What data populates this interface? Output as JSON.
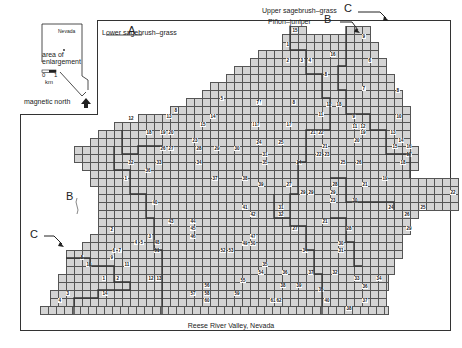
{
  "inset": {
    "state_label": "Nevada",
    "area_label_line1": "area of",
    "area_label_line2": "enlargement",
    "scale_zero": "0",
    "scale_one": "1",
    "scale_unit": "km",
    "north_label": "magnetic north"
  },
  "labels": {
    "lower_sagebrush": "Lower sagebrush–grass",
    "lower_sagebrush_letter": "A",
    "upper_sagebrush": "Upper sagebrush–grass",
    "upper_sagebrush_letter": "C",
    "pinon_juniper": "Piñon–juniper",
    "pinon_juniper_letter": "B",
    "left_b": "B",
    "left_c": "C"
  },
  "caption": "Reese River Valley, Nevada",
  "cell_numbers": [
    {
      "n": "15",
      "x": 292,
      "y": 28
    },
    {
      "n": "9",
      "x": 362,
      "y": 34
    },
    {
      "n": "1",
      "x": 286,
      "y": 42
    },
    {
      "n": "16",
      "x": 330,
      "y": 52
    },
    {
      "n": "2",
      "x": 286,
      "y": 58
    },
    {
      "n": "3",
      "x": 300,
      "y": 58
    },
    {
      "n": "4",
      "x": 308,
      "y": 58
    },
    {
      "n": "6",
      "x": 368,
      "y": 58
    },
    {
      "n": "5",
      "x": 220,
      "y": 96
    },
    {
      "n": "7",
      "x": 258,
      "y": 100
    },
    {
      "n": "7",
      "x": 362,
      "y": 86
    },
    {
      "n": "8",
      "x": 324,
      "y": 72
    },
    {
      "n": "7",
      "x": 256,
      "y": 100
    },
    {
      "n": "8",
      "x": 292,
      "y": 100
    },
    {
      "n": "8",
      "x": 174,
      "y": 108
    },
    {
      "n": "8",
      "x": 396,
      "y": 88
    },
    {
      "n": "12",
      "x": 326,
      "y": 102
    },
    {
      "n": "18",
      "x": 336,
      "y": 102
    },
    {
      "n": "9",
      "x": 352,
      "y": 114
    },
    {
      "n": "10",
      "x": 396,
      "y": 114
    },
    {
      "n": "11",
      "x": 318,
      "y": 112
    },
    {
      "n": "12",
      "x": 128,
      "y": 116
    },
    {
      "n": "13",
      "x": 166,
      "y": 114
    },
    {
      "n": "14",
      "x": 210,
      "y": 114
    },
    {
      "n": "15",
      "x": 200,
      "y": 122
    },
    {
      "n": "16",
      "x": 252,
      "y": 122
    },
    {
      "n": "17",
      "x": 254,
      "y": 122
    },
    {
      "n": "17",
      "x": 286,
      "y": 122
    },
    {
      "n": "11",
      "x": 352,
      "y": 124
    },
    {
      "n": "12",
      "x": 360,
      "y": 124
    },
    {
      "n": "18",
      "x": 146,
      "y": 130
    },
    {
      "n": "19",
      "x": 160,
      "y": 130
    },
    {
      "n": "20",
      "x": 168,
      "y": 130
    },
    {
      "n": "19",
      "x": 360,
      "y": 130
    },
    {
      "n": "13",
      "x": 390,
      "y": 130
    },
    {
      "n": "21",
      "x": 310,
      "y": 130
    },
    {
      "n": "22",
      "x": 318,
      "y": 130
    },
    {
      "n": "23",
      "x": 192,
      "y": 138
    },
    {
      "n": "24",
      "x": 256,
      "y": 140
    },
    {
      "n": "25",
      "x": 278,
      "y": 140
    },
    {
      "n": "20",
      "x": 354,
      "y": 138
    },
    {
      "n": "14",
      "x": 398,
      "y": 138
    },
    {
      "n": "26",
      "x": 160,
      "y": 146
    },
    {
      "n": "27",
      "x": 168,
      "y": 146
    },
    {
      "n": "28",
      "x": 196,
      "y": 146
    },
    {
      "n": "29",
      "x": 214,
      "y": 146
    },
    {
      "n": "30",
      "x": 234,
      "y": 146
    },
    {
      "n": "21",
      "x": 322,
      "y": 144
    },
    {
      "n": "15",
      "x": 392,
      "y": 144
    },
    {
      "n": "16",
      "x": 406,
      "y": 144
    },
    {
      "n": "31",
      "x": 262,
      "y": 152
    },
    {
      "n": "22",
      "x": 316,
      "y": 152
    },
    {
      "n": "23",
      "x": 324,
      "y": 152
    },
    {
      "n": "17",
      "x": 406,
      "y": 152
    },
    {
      "n": "32",
      "x": 128,
      "y": 160
    },
    {
      "n": "33",
      "x": 156,
      "y": 160
    },
    {
      "n": "34",
      "x": 196,
      "y": 160
    },
    {
      "n": "35",
      "x": 262,
      "y": 160
    },
    {
      "n": "24",
      "x": 296,
      "y": 160
    },
    {
      "n": "25",
      "x": 340,
      "y": 160
    },
    {
      "n": "26",
      "x": 356,
      "y": 160
    },
    {
      "n": "18",
      "x": 400,
      "y": 160
    },
    {
      "n": "36",
      "x": 145,
      "y": 168
    },
    {
      "n": "1",
      "x": 124,
      "y": 176
    },
    {
      "n": "37",
      "x": 212,
      "y": 176
    },
    {
      "n": "38",
      "x": 242,
      "y": 176
    },
    {
      "n": "19",
      "x": 382,
      "y": 176
    },
    {
      "n": "39",
      "x": 258,
      "y": 182
    },
    {
      "n": "27",
      "x": 286,
      "y": 182
    },
    {
      "n": "28",
      "x": 332,
      "y": 182
    },
    {
      "n": "21",
      "x": 362,
      "y": 182
    },
    {
      "n": "29",
      "x": 300,
      "y": 190
    },
    {
      "n": "29",
      "x": 308,
      "y": 190
    },
    {
      "n": "29",
      "x": 330,
      "y": 190
    },
    {
      "n": "22",
      "x": 450,
      "y": 190
    },
    {
      "n": "23",
      "x": 330,
      "y": 198
    },
    {
      "n": "30",
      "x": 352,
      "y": 198
    },
    {
      "n": "40",
      "x": 152,
      "y": 200
    },
    {
      "n": "24",
      "x": 388,
      "y": 205
    },
    {
      "n": "25",
      "x": 420,
      "y": 205
    },
    {
      "n": "26",
      "x": 404,
      "y": 212
    },
    {
      "n": "41",
      "x": 242,
      "y": 205
    },
    {
      "n": "31",
      "x": 278,
      "y": 205
    },
    {
      "n": "42",
      "x": 250,
      "y": 212
    },
    {
      "n": "32",
      "x": 278,
      "y": 212
    },
    {
      "n": "43",
      "x": 168,
      "y": 219
    },
    {
      "n": "44",
      "x": 190,
      "y": 219
    },
    {
      "n": "21",
      "x": 322,
      "y": 219
    },
    {
      "n": "2",
      "x": 110,
      "y": 227
    },
    {
      "n": "45",
      "x": 190,
      "y": 226
    },
    {
      "n": "27",
      "x": 292,
      "y": 226
    },
    {
      "n": "28",
      "x": 346,
      "y": 226
    },
    {
      "n": "29",
      "x": 406,
      "y": 226
    },
    {
      "n": "3",
      "x": 148,
      "y": 234
    },
    {
      "n": "46",
      "x": 190,
      "y": 234
    },
    {
      "n": "47",
      "x": 250,
      "y": 234
    },
    {
      "n": "4",
      "x": 134,
      "y": 240
    },
    {
      "n": "5",
      "x": 140,
      "y": 240
    },
    {
      "n": "48",
      "x": 154,
      "y": 240
    },
    {
      "n": "49",
      "x": 242,
      "y": 241
    },
    {
      "n": "50",
      "x": 250,
      "y": 241
    },
    {
      "n": "30",
      "x": 338,
      "y": 241
    },
    {
      "n": "6",
      "x": 112,
      "y": 248
    },
    {
      "n": "7",
      "x": 118,
      "y": 248
    },
    {
      "n": "51",
      "x": 154,
      "y": 248
    },
    {
      "n": "52",
      "x": 220,
      "y": 248
    },
    {
      "n": "53",
      "x": 228,
      "y": 248
    },
    {
      "n": "34",
      "x": 302,
      "y": 248
    },
    {
      "n": "31",
      "x": 338,
      "y": 248
    },
    {
      "n": "8",
      "x": 80,
      "y": 255
    },
    {
      "n": "9",
      "x": 110,
      "y": 255
    },
    {
      "n": "10",
      "x": 86,
      "y": 262
    },
    {
      "n": "11",
      "x": 124,
      "y": 262
    },
    {
      "n": "35",
      "x": 262,
      "y": 262
    },
    {
      "n": "54",
      "x": 258,
      "y": 270
    },
    {
      "n": "36",
      "x": 282,
      "y": 270
    },
    {
      "n": "37",
      "x": 308,
      "y": 270
    },
    {
      "n": "32",
      "x": 332,
      "y": 270
    },
    {
      "n": "1",
      "x": 102,
      "y": 276
    },
    {
      "n": "2",
      "x": 116,
      "y": 276
    },
    {
      "n": "12",
      "x": 148,
      "y": 276
    },
    {
      "n": "13",
      "x": 156,
      "y": 276
    },
    {
      "n": "55",
      "x": 240,
      "y": 278
    },
    {
      "n": "33",
      "x": 354,
      "y": 276
    },
    {
      "n": "34",
      "x": 376,
      "y": 276
    },
    {
      "n": "56",
      "x": 204,
      "y": 283
    },
    {
      "n": "38",
      "x": 280,
      "y": 283
    },
    {
      "n": "39",
      "x": 296,
      "y": 283
    },
    {
      "n": "35",
      "x": 318,
      "y": 287
    },
    {
      "n": "36",
      "x": 362,
      "y": 284
    },
    {
      "n": "3",
      "x": 66,
      "y": 291
    },
    {
      "n": "14",
      "x": 102,
      "y": 291
    },
    {
      "n": "57",
      "x": 190,
      "y": 291
    },
    {
      "n": "58",
      "x": 204,
      "y": 291
    },
    {
      "n": "59",
      "x": 234,
      "y": 291
    },
    {
      "n": "4",
      "x": 58,
      "y": 298
    },
    {
      "n": "60",
      "x": 204,
      "y": 298
    },
    {
      "n": "61",
      "x": 270,
      "y": 298
    },
    {
      "n": "62",
      "x": 276,
      "y": 298
    },
    {
      "n": "40",
      "x": 324,
      "y": 298
    },
    {
      "n": "37",
      "x": 362,
      "y": 298
    },
    {
      "n": "38",
      "x": 346,
      "y": 306
    }
  ]
}
